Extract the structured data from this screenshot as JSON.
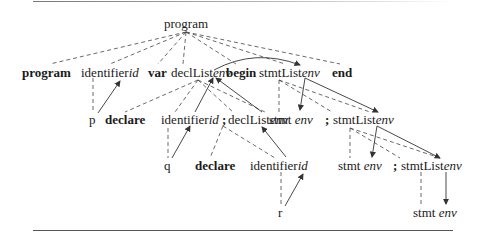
{
  "diagram": {
    "type": "annotated-parse-tree",
    "root": "program",
    "nodes": {
      "root": {
        "label": "program"
      },
      "l1_program": {
        "label": "program",
        "bold": true
      },
      "l1_identifier": {
        "label": "identifier",
        "attr": "id"
      },
      "l1_var": {
        "label": "var",
        "bold": true
      },
      "l1_declList": {
        "label": "declList",
        "attr": "env"
      },
      "l1_begin": {
        "label": "begin",
        "bold": true
      },
      "l1_stmtList": {
        "label": "stmtList",
        "attr": "env"
      },
      "l1_end": {
        "label": "end",
        "bold": true
      },
      "l2_p": {
        "label": "p"
      },
      "l2_declare": {
        "label": "declare",
        "bold": true
      },
      "l2_identifier": {
        "label": "identifier",
        "attr": "id"
      },
      "l2_semi": {
        "label": ";",
        "bold": true
      },
      "l2_declList": {
        "label": "declList",
        "attr": "env"
      },
      "l2_stmt": {
        "label": "stmt",
        "attr": "env"
      },
      "l2_semi2": {
        "label": ";",
        "bold": true
      },
      "l2_stmtList": {
        "label": "stmtList",
        "attr": "env"
      },
      "l3_q": {
        "label": "q"
      },
      "l3_declare": {
        "label": "declare",
        "bold": true
      },
      "l3_identifier": {
        "label": "identifier",
        "attr": "id"
      },
      "l3_stmt": {
        "label": "stmt",
        "attr": "env"
      },
      "l3_semi": {
        "label": ";",
        "bold": true
      },
      "l3_stmtList": {
        "label": "stmtList",
        "attr": "env"
      },
      "l4_r": {
        "label": "r"
      },
      "l4_stmt": {
        "label": "stmt",
        "attr": "env"
      }
    },
    "edge_styles": {
      "dashed": "parse-tree child edge",
      "solid_arrow": "attribute dependency / flow"
    }
  }
}
